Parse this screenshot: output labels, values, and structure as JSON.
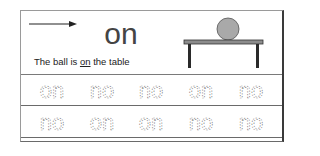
{
  "worksheet": {
    "header": {
      "word": "on",
      "arrow": "right-arrow",
      "sentence": {
        "before": "The ball is ",
        "highlight": "on",
        "after": " the table"
      },
      "picture": "ball-on-table"
    },
    "trace_rows": [
      {
        "words": [
          "on",
          "no",
          "no",
          "on",
          "no"
        ]
      },
      {
        "words": [
          "no",
          "on",
          "on",
          "no",
          "no"
        ]
      }
    ],
    "colors": {
      "ball": "#a9a9a9",
      "table_top": "#8c8c8c",
      "table_legs": "#2a2a2a",
      "trace_dots": "#7a7a7a",
      "border": "#3a3a3a"
    }
  }
}
